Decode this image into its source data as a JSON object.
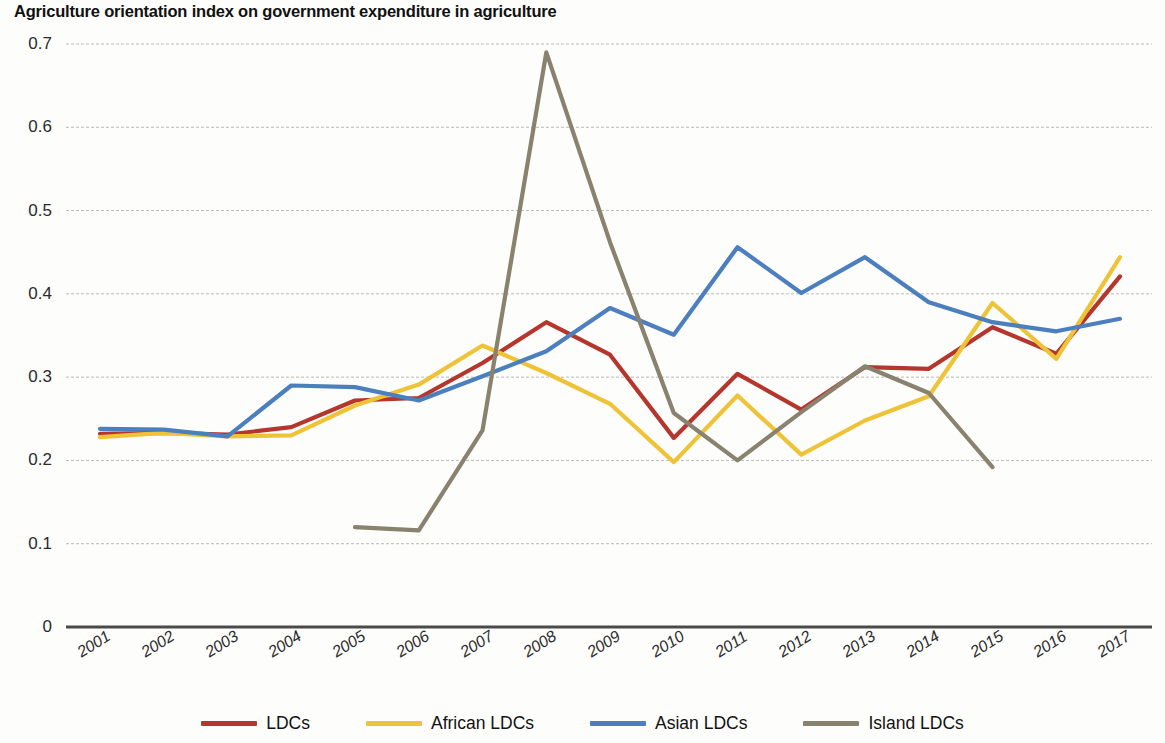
{
  "chart_data": {
    "type": "line",
    "title": "Agriculture orientation index on government expenditure in agriculture",
    "xlabel": "",
    "ylabel": "",
    "grid": true,
    "legend_position": "bottom",
    "ylim": [
      0,
      0.7
    ],
    "yticks": [
      "0",
      "0.1",
      "0.2",
      "0.3",
      "0.4",
      "0.5",
      "0.6",
      "0.7"
    ],
    "ytick_values": [
      0,
      0.1,
      0.2,
      0.3,
      0.4,
      0.5,
      0.6,
      0.7
    ],
    "categories": [
      "2001",
      "2002",
      "2003",
      "2004",
      "2005",
      "2006",
      "2007",
      "2008",
      "2009",
      "2010",
      "2011",
      "2012",
      "2013",
      "2014",
      "2015",
      "2016",
      "2017"
    ],
    "x": [
      2001,
      2002,
      2003,
      2004,
      2005,
      2006,
      2007,
      2008,
      2009,
      2010,
      2011,
      2012,
      2013,
      2014,
      2015,
      2016,
      2017
    ],
    "series": [
      {
        "name": "LDCs",
        "color": "#b5362c",
        "values": [
          0.232,
          0.233,
          0.231,
          0.24,
          0.272,
          0.275,
          0.317,
          0.366,
          0.327,
          0.227,
          0.304,
          0.261,
          0.312,
          0.31,
          0.36,
          0.328,
          0.421
        ]
      },
      {
        "name": "African LDCs",
        "color": "#efc337",
        "values": [
          0.228,
          0.233,
          0.229,
          0.23,
          0.266,
          0.291,
          0.338,
          0.305,
          0.268,
          0.198,
          0.278,
          0.207,
          0.248,
          0.277,
          0.389,
          0.322,
          0.444
        ]
      },
      {
        "name": "Asian LDCs",
        "color": "#4b7fbd",
        "values": [
          0.238,
          0.237,
          0.229,
          0.29,
          0.288,
          0.272,
          0.301,
          0.331,
          0.383,
          0.351,
          0.456,
          0.401,
          0.444,
          0.39,
          0.366,
          0.355,
          0.37
        ]
      },
      {
        "name": "Island LDCs",
        "color": "#89826f",
        "values": [
          null,
          null,
          null,
          null,
          0.12,
          0.116,
          0.236,
          0.69,
          0.462,
          0.257,
          0.2,
          0.258,
          0.313,
          0.281,
          0.192,
          null,
          null
        ]
      }
    ]
  },
  "legend": {
    "items": [
      {
        "label": "LDCs",
        "color": "#b5362c"
      },
      {
        "label": "African LDCs",
        "color": "#efc337"
      },
      {
        "label": "Asian LDCs",
        "color": "#4b7fbd"
      },
      {
        "label": "Island LDCs",
        "color": "#89826f"
      }
    ]
  },
  "axis_colors": {
    "grid": "#b9b9b9",
    "axis": "#4a4a4a",
    "text": "#2b2b2b"
  }
}
